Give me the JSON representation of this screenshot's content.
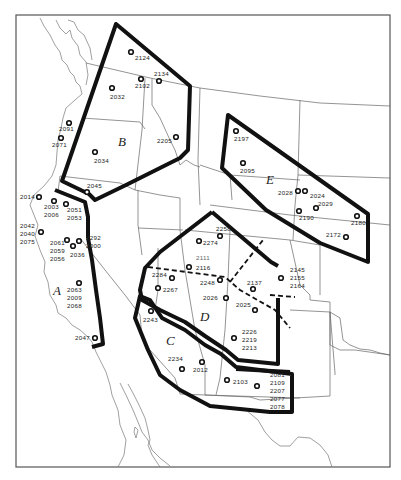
{
  "regions": [
    {
      "id": "A",
      "label": "A",
      "x": 54,
      "y": 281
    },
    {
      "id": "B",
      "label": "B",
      "x": 120,
      "y": 144
    },
    {
      "id": "C",
      "label": "C",
      "x": 165,
      "y": 341
    },
    {
      "id": "D",
      "label": "D",
      "x": 200,
      "y": 320
    },
    {
      "id": "E",
      "label": "E",
      "x": 265,
      "y": 182
    }
  ],
  "sites": [
    {
      "id": "2124",
      "label": "2124",
      "x": 131,
      "y": 52,
      "lx": 135,
      "ly": 60
    },
    {
      "id": "2134",
      "label": "2134",
      "x": 159,
      "y": 81,
      "lx": 154,
      "ly": 76
    },
    {
      "id": "2102",
      "label": "2102",
      "x": 141,
      "y": 79,
      "lx": 135,
      "ly": 88
    },
    {
      "id": "2032",
      "label": "2032",
      "x": 112,
      "y": 88,
      "lx": 110,
      "ly": 99
    },
    {
      "id": "2091",
      "label": "2091",
      "x": 69,
      "y": 123,
      "lx": 59,
      "ly": 131
    },
    {
      "id": "2071",
      "label": "2071",
      "x": 61,
      "y": 138,
      "lx": 52,
      "ly": 147
    },
    {
      "id": "2205",
      "label": "2205",
      "x": 176,
      "y": 137,
      "lx": 157,
      "ly": 143
    },
    {
      "id": "2034",
      "label": "2034",
      "x": 95,
      "y": 152,
      "lx": 94,
      "ly": 163
    },
    {
      "id": "2045",
      "label": "2045",
      "x": 87,
      "y": 192,
      "lx": 87,
      "ly": 188
    },
    {
      "id": "2014",
      "label": "2014",
      "x": 39,
      "y": 197,
      "lx": 20,
      "ly": 199
    },
    {
      "id": "2003",
      "label": "2003 2006",
      "x": 54,
      "y": 201,
      "lx": 44,
      "ly": 209
    },
    {
      "id": "2051",
      "label": "2051 2053",
      "x": 66,
      "y": 204,
      "lx": 67,
      "ly": 212
    },
    {
      "id": "2042",
      "label": "2042 2040 2075",
      "x": 41,
      "y": 232,
      "lx": 20,
      "ly": 228
    },
    {
      "id": "2061",
      "label": "2061 2059 2056",
      "x": 67,
      "y": 240,
      "lx": 50,
      "ly": 245
    },
    {
      "id": "2292",
      "label": "2292 2000",
      "x": 79,
      "y": 241,
      "lx": 86,
      "ly": 240
    },
    {
      "id": "2036",
      "label": "2036",
      "x": 73,
      "y": 246,
      "lx": 70,
      "ly": 257
    },
    {
      "id": "2063",
      "label": "2063 2009 2068",
      "x": 79,
      "y": 283,
      "lx": 67,
      "ly": 292
    },
    {
      "id": "2047",
      "label": "2047",
      "x": 95,
      "y": 338,
      "lx": 75,
      "ly": 340
    },
    {
      "id": "2197",
      "label": "2197",
      "x": 236,
      "y": 131,
      "lx": 234,
      "ly": 141
    },
    {
      "id": "2095",
      "label": "2095",
      "x": 243,
      "y": 163,
      "lx": 240,
      "ly": 173
    },
    {
      "id": "2028",
      "label": "2028",
      "x": 298,
      "y": 191,
      "lx": 278,
      "ly": 195
    },
    {
      "id": "2024",
      "label": "2024",
      "x": 305,
      "y": 191,
      "lx": 310,
      "ly": 198
    },
    {
      "id": "2029",
      "label": "2029",
      "x": 316,
      "y": 208,
      "lx": 318,
      "ly": 206
    },
    {
      "id": "2190",
      "label": "2190",
      "x": 299,
      "y": 211,
      "lx": 299,
      "ly": 220
    },
    {
      "id": "2180",
      "label": "2180",
      "x": 357,
      "y": 216,
      "lx": 351,
      "ly": 225
    },
    {
      "id": "2172",
      "label": "2172",
      "x": 346,
      "y": 237,
      "lx": 326,
      "ly": 237
    },
    {
      "id": "2258",
      "label": "2258",
      "x": 220,
      "y": 236,
      "lx": 216,
      "ly": 231
    },
    {
      "id": "2274",
      "label": "2274",
      "x": 199,
      "y": 241,
      "lx": 203,
      "ly": 245
    },
    {
      "id": "2111",
      "label": "2111",
      "x": 0,
      "y": 0,
      "lx": 196,
      "ly": 260,
      "faint": true,
      "noMarker": true
    },
    {
      "id": "2116",
      "label": "2116",
      "x": 189,
      "y": 267,
      "lx": 196,
      "ly": 270
    },
    {
      "id": "2284",
      "label": "2284",
      "x": 172,
      "y": 278,
      "lx": 152,
      "ly": 277
    },
    {
      "id": "2248",
      "label": "2248",
      "x": 220,
      "y": 280,
      "lx": 200,
      "ly": 285
    },
    {
      "id": "2267",
      "label": "2267",
      "x": 158,
      "y": 288,
      "lx": 163,
      "ly": 292
    },
    {
      "id": "2137",
      "label": "2137",
      "x": 253,
      "y": 289,
      "lx": 247,
      "ly": 285
    },
    {
      "id": "2145",
      "label": "2145 2155 2164",
      "x": 281,
      "y": 278,
      "lx": 290,
      "ly": 272
    },
    {
      "id": "2026",
      "label": "2026",
      "x": 226,
      "y": 298,
      "lx": 203,
      "ly": 300
    },
    {
      "id": "2025",
      "label": "2025",
      "x": 255,
      "y": 310,
      "lx": 236,
      "ly": 307
    },
    {
      "id": "2243",
      "label": "2243",
      "x": 151,
      "y": 311,
      "lx": 143,
      "ly": 322
    },
    {
      "id": "2226",
      "label": "2226 2219 2213",
      "x": 234,
      "y": 338,
      "lx": 242,
      "ly": 334
    },
    {
      "id": "2234",
      "label": "2234",
      "x": 182,
      "y": 369,
      "lx": 168,
      "ly": 361
    },
    {
      "id": "2012",
      "label": "2012",
      "x": 202,
      "y": 362,
      "lx": 193,
      "ly": 372
    },
    {
      "id": "2103",
      "label": "2103",
      "x": 227,
      "y": 380,
      "lx": 233,
      "ly": 384
    },
    {
      "id": "2081",
      "label": "2081 2109 2207 2077 2078",
      "x": 257,
      "y": 386,
      "lx": 270,
      "ly": 377
    }
  ]
}
